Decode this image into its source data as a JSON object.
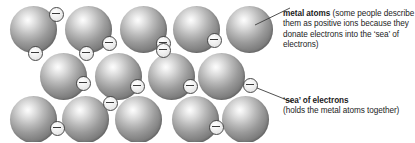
{
  "diagram": {
    "colors": {
      "atom_light": "#fdfdfd",
      "atom_mid": "#9a9a9a",
      "atom_dark": "#767676",
      "electron_fill": "#f0f0f0",
      "electron_stroke": "#4a4a4a",
      "text": "#1c1c1c",
      "leader_line": "#3c3c3c",
      "background": "#ffffff"
    },
    "atom_rows": [
      {
        "row": 1,
        "count": 5,
        "cy": 29,
        "r": 23.5,
        "cx": [
          33,
          88,
          143,
          196,
          249
        ]
      },
      {
        "row": 2,
        "count": 4,
        "cy": 76,
        "r": 23.5,
        "cx": [
          63,
          118,
          171,
          221
        ]
      },
      {
        "row": 3,
        "count": 5,
        "cy": 119,
        "r": 23.5,
        "cx": [
          33,
          85,
          138,
          195,
          245
        ]
      }
    ],
    "electrons": [
      {
        "cx": 56,
        "cy": 14,
        "r": 7.5
      },
      {
        "cx": 109,
        "cy": 43,
        "r": 7.5
      },
      {
        "cx": 163,
        "cy": 43,
        "r": 7.5
      },
      {
        "cx": 214,
        "cy": 40,
        "r": 7.5
      },
      {
        "cx": 35,
        "cy": 53,
        "r": 7.5
      },
      {
        "cx": 86,
        "cy": 53,
        "r": 7.5
      },
      {
        "cx": 163,
        "cy": 50,
        "r": 7.5
      },
      {
        "cx": 83,
        "cy": 83,
        "r": 7.5
      },
      {
        "cx": 137,
        "cy": 86,
        "r": 7.5
      },
      {
        "cx": 190,
        "cy": 86,
        "r": 7.5
      },
      {
        "cx": 250,
        "cy": 85,
        "r": 7.5
      },
      {
        "cx": 110,
        "cy": 103,
        "r": 7.5
      },
      {
        "cx": 57,
        "cy": 128,
        "r": 7.5
      },
      {
        "cx": 216,
        "cy": 127,
        "r": 7.5
      }
    ],
    "leaders": [
      {
        "name": "metal-atoms",
        "x1": 255,
        "y1": 25,
        "x2": 290,
        "y2": 8
      },
      {
        "name": "sea-of-electrons",
        "x1": 257,
        "y1": 88,
        "x2": 292,
        "y2": 102
      }
    ]
  },
  "annotations": {
    "metal_atoms": {
      "heading": "metal atoms",
      "body": " (some people describe them as positive ions because they donate electrons into the ‘sea’ of electrons)"
    },
    "sea_of_electrons": {
      "heading": "‘sea’ of electrons",
      "body": "(holds the metal atoms together)"
    }
  }
}
